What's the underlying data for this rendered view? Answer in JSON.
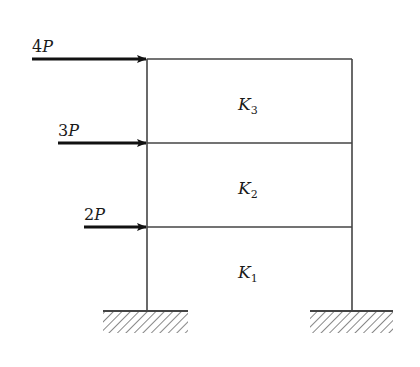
{
  "diagram": {
    "type": "multi-storey frame",
    "colors": {
      "frame": "#444444",
      "arrow": "#111111",
      "text": "#1a1a1a",
      "hatch": "#555555"
    },
    "frame": {
      "left_x": 147,
      "right_x": 352,
      "floors_y": [
        59,
        143,
        227
      ],
      "base_y": 311
    },
    "loads": [
      {
        "label_coef": "4",
        "label_var": "P",
        "x_start": 32,
        "y": 59
      },
      {
        "label_coef": "3",
        "label_var": "P",
        "x_start": 58,
        "y": 143
      },
      {
        "label_coef": "2",
        "label_var": "P",
        "x_start": 84,
        "y": 227
      }
    ],
    "stiffness_labels": [
      {
        "var": "K",
        "sub": "3",
        "x": 238,
        "y": 110
      },
      {
        "var": "K",
        "sub": "2",
        "x": 238,
        "y": 194
      },
      {
        "var": "K",
        "sub": "1",
        "x": 238,
        "y": 278
      }
    ],
    "supports": [
      {
        "name": "left-fixed-support",
        "x1": 103,
        "x2": 188,
        "y": 311
      },
      {
        "name": "right-fixed-support",
        "x1": 310,
        "x2": 393,
        "y": 311
      }
    ]
  }
}
